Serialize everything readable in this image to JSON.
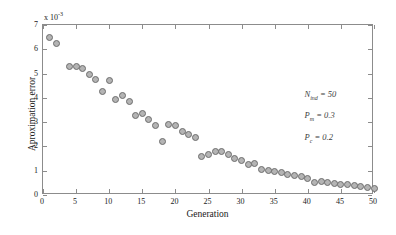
{
  "chart_data": {
    "type": "scatter",
    "title": "",
    "xlabel": "Generation",
    "ylabel": "Aproximation error",
    "y_multiplier": "x 10",
    "y_multiplier_exp": "-3",
    "xlim": [
      0,
      50
    ],
    "ylim": [
      0,
      7
    ],
    "xticks": [
      0,
      5,
      10,
      15,
      20,
      25,
      30,
      35,
      40,
      45,
      50
    ],
    "xticklabels": [
      "0",
      "5",
      "10",
      "15",
      "20",
      "25",
      "30",
      "35",
      "40",
      "45",
      "50"
    ],
    "yticks": [
      0,
      1,
      2,
      3,
      4,
      5,
      6,
      7
    ],
    "yticklabels": [
      "0",
      "1",
      "2",
      "3",
      "4",
      "5",
      "6",
      "7"
    ],
    "grid": false,
    "legend": false,
    "marker": {
      "shape": "circle",
      "fill_color": "#b4b4b4",
      "edge_color": "#6e6e6e",
      "size_px": 7
    },
    "x": [
      1,
      2,
      4,
      5,
      6,
      7,
      8,
      9,
      10,
      11,
      12,
      13,
      14,
      15,
      16,
      17,
      18,
      19,
      20,
      21,
      22,
      23,
      24,
      25,
      26,
      27,
      28,
      29,
      30,
      31,
      32,
      33,
      34,
      35,
      36,
      37,
      38,
      39,
      40,
      41,
      42,
      43,
      44,
      45,
      46,
      47,
      48,
      49,
      50
    ],
    "y": [
      6.5,
      6.25,
      5.28,
      5.3,
      5.2,
      4.95,
      4.75,
      4.25,
      4.7,
      3.95,
      4.1,
      3.85,
      3.28,
      3.35,
      3.1,
      2.85,
      2.2,
      2.9,
      2.85,
      2.6,
      2.5,
      2.35,
      1.6,
      1.65,
      1.78,
      1.8,
      1.65,
      1.5,
      1.42,
      1.25,
      1.28,
      1.05,
      1.0,
      0.98,
      0.92,
      0.85,
      0.8,
      0.78,
      0.7,
      0.52,
      0.55,
      0.5,
      0.48,
      0.45,
      0.42,
      0.38,
      0.35,
      0.3,
      0.28
    ],
    "annotations": [
      {
        "symbol": "N",
        "subscript": "ind",
        "relation": "= 50",
        "x_data": 39.5,
        "y_data": 4.35
      },
      {
        "symbol": "P",
        "subscript": "m",
        "relation": "= 0.3",
        "x_data": 39.5,
        "y_data": 3.48
      },
      {
        "symbol": "P",
        "subscript": "c",
        "relation": "= 0.2",
        "x_data": 39.5,
        "y_data": 2.6
      }
    ]
  }
}
